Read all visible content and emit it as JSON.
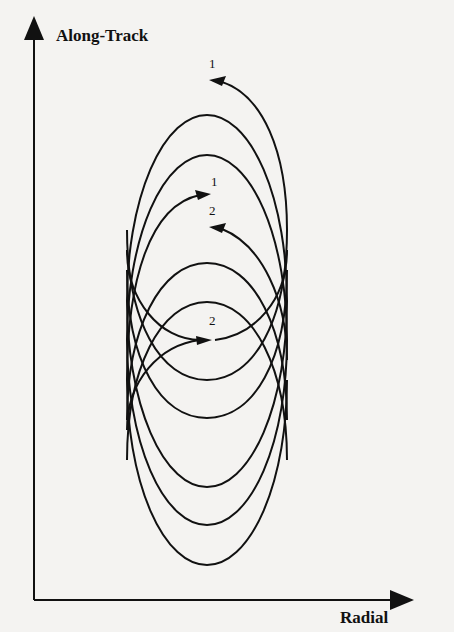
{
  "figure": {
    "y_axis_label": "Along-Track",
    "x_axis_label": "Radial",
    "markers": [
      {
        "id": "start-1",
        "label": "1",
        "x": 213,
        "y": 72,
        "arrow": "left"
      },
      {
        "id": "end-1",
        "label": "1",
        "x": 215,
        "y": 189,
        "arrow": "right"
      },
      {
        "id": "start-2",
        "label": "2",
        "x": 213,
        "y": 218,
        "arrow": "left"
      },
      {
        "id": "end-2",
        "label": "2",
        "x": 213,
        "y": 328,
        "arrow": "right"
      }
    ],
    "line_color": "#111111"
  }
}
